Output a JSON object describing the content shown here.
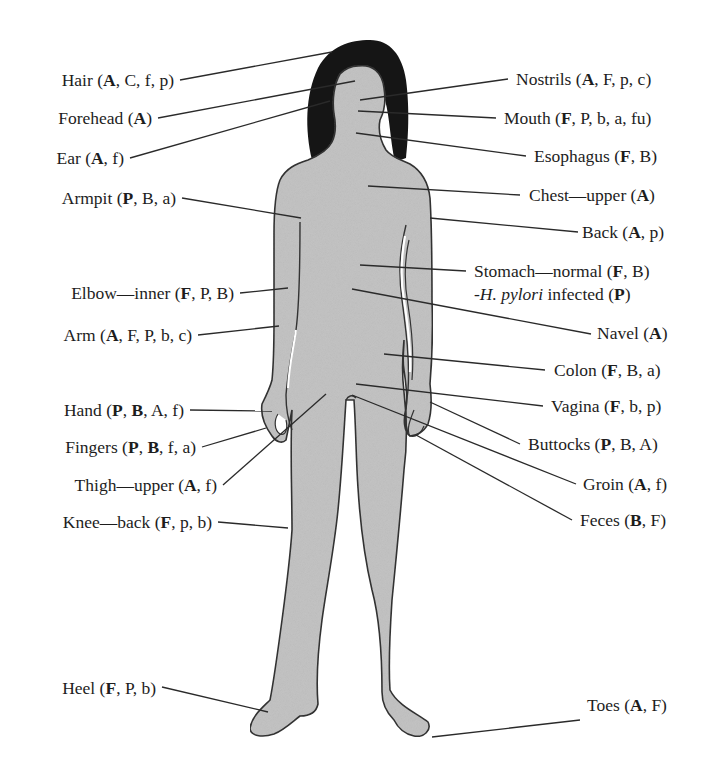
{
  "diagram": {
    "type": "anatomical-labeled-figure",
    "body_fill_color": "#c4c4c4",
    "hair_color": "#151515",
    "outline_color": "#333333",
    "leader_line_color": "#2a2a2a"
  },
  "labels_left": [
    {
      "id": "hair",
      "site": "Hair",
      "bold": [
        "A"
      ],
      "normal": [
        "C",
        "f",
        "p"
      ],
      "order": [
        "A",
        "C",
        "f",
        "p"
      ]
    },
    {
      "id": "forehead",
      "site": "Forehead",
      "order": [
        "A"
      ],
      "bold": [
        "A"
      ]
    },
    {
      "id": "ear",
      "site": "Ear",
      "order": [
        "A",
        "f"
      ],
      "bold": [
        "A"
      ]
    },
    {
      "id": "armpit",
      "site": "Armpit",
      "order": [
        "P",
        "B",
        "a"
      ],
      "bold": [
        "P"
      ]
    },
    {
      "id": "elbow",
      "site": "Elbow—inner",
      "order": [
        "F",
        "P",
        "B"
      ],
      "bold": [
        "F"
      ]
    },
    {
      "id": "arm",
      "site": "Arm",
      "order": [
        "A",
        "F",
        "P",
        "b",
        "c"
      ],
      "bold": [
        "A"
      ]
    },
    {
      "id": "hand",
      "site": "Hand",
      "order": [
        "P",
        "B",
        "A",
        "f"
      ],
      "bold": [
        "P",
        "B"
      ]
    },
    {
      "id": "fingers",
      "site": "Fingers",
      "order": [
        "P",
        "B",
        "f",
        "a"
      ],
      "bold": [
        "P",
        "B"
      ]
    },
    {
      "id": "thigh",
      "site": "Thigh—upper",
      "order": [
        "A",
        "f"
      ],
      "bold": [
        "A"
      ]
    },
    {
      "id": "knee",
      "site": "Knee—back",
      "order": [
        "F",
        "p",
        "b"
      ],
      "bold": [
        "F"
      ]
    },
    {
      "id": "heel",
      "site": "Heel",
      "order": [
        "F",
        "P",
        "b"
      ],
      "bold": [
        "F"
      ]
    }
  ],
  "labels_right": [
    {
      "id": "nostrils",
      "site": "Nostrils",
      "order": [
        "A",
        "F",
        "p",
        "c"
      ],
      "bold": [
        "A"
      ]
    },
    {
      "id": "mouth",
      "site": "Mouth",
      "order": [
        "F",
        "P",
        "b",
        "a",
        "fu"
      ],
      "bold": [
        "F"
      ]
    },
    {
      "id": "esophagus",
      "site": "Esophagus",
      "order": [
        "F",
        "B"
      ],
      "bold": [
        "F"
      ]
    },
    {
      "id": "chest",
      "site": "Chest—upper",
      "order": [
        "A"
      ],
      "bold": [
        "A"
      ]
    },
    {
      "id": "back",
      "site": "Back",
      "order": [
        "A",
        "p"
      ],
      "bold": [
        "A"
      ]
    },
    {
      "id": "stomach",
      "site": "Stomach—normal",
      "order": [
        "F",
        "B"
      ],
      "bold": [
        "F"
      ],
      "sub": {
        "prefix": "-",
        "italic": "H. pylori",
        "suffix": " infected",
        "order": [
          "P"
        ],
        "bold": [
          "P"
        ]
      }
    },
    {
      "id": "navel",
      "site": "Navel",
      "order": [
        "A"
      ],
      "bold": [
        "A"
      ]
    },
    {
      "id": "colon",
      "site": "Colon",
      "order": [
        "F",
        "B",
        "a"
      ],
      "bold": [
        "F"
      ]
    },
    {
      "id": "vagina",
      "site": "Vagina",
      "order": [
        "F",
        "b",
        "p"
      ],
      "bold": [
        "F"
      ]
    },
    {
      "id": "buttocks",
      "site": "Buttocks",
      "order": [
        "P",
        "B",
        "A"
      ],
      "bold": [
        "P"
      ]
    },
    {
      "id": "groin",
      "site": "Groin",
      "order": [
        "A",
        "f"
      ],
      "bold": [
        "A"
      ]
    },
    {
      "id": "feces",
      "site": "Feces",
      "order": [
        "B",
        "F"
      ],
      "bold": [
        "B"
      ]
    },
    {
      "id": "toes",
      "site": "Toes",
      "order": [
        "A",
        "F"
      ],
      "bold": [
        "A"
      ]
    }
  ]
}
